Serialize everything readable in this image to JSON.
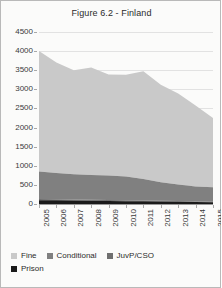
{
  "chart_data": {
    "type": "area",
    "title": "Figure 6.2 - Finland",
    "xlabel": "",
    "ylabel": "",
    "ylim": [
      0,
      4500
    ],
    "yticks": [
      0,
      500,
      1000,
      1500,
      2000,
      2500,
      3000,
      3500,
      4000,
      4500
    ],
    "grid": true,
    "stacked": true,
    "legend_position": "bottom",
    "categories": [
      "2005",
      "2006",
      "2007",
      "2008",
      "2009",
      "2010",
      "2011",
      "2012",
      "2013",
      "2014",
      "2015"
    ],
    "series": [
      {
        "name": "Prison",
        "color": "#1a1a1a",
        "values": [
          100,
          95,
          90,
          85,
          80,
          75,
          70,
          65,
          60,
          50,
          45
        ]
      },
      {
        "name": "JuvP/CSO",
        "color": "#6f6f6f",
        "values": [
          30,
          28,
          26,
          25,
          24,
          23,
          22,
          21,
          20,
          18,
          17
        ]
      },
      {
        "name": "Conditional",
        "color": "#808080",
        "values": [
          720,
          690,
          665,
          650,
          640,
          620,
          560,
          480,
          430,
          390,
          378
        ]
      },
      {
        "name": "Fine",
        "color": "#c9c9c9",
        "values": [
          3150,
          2887,
          2719,
          2810,
          2646,
          2662,
          2818,
          2554,
          2380,
          2122,
          1810
        ]
      }
    ],
    "series_totals": [
      4000,
      3700,
      3500,
      3570,
      3390,
      3380,
      3470,
      3120,
      2890,
      2580,
      2250
    ]
  },
  "legend": {
    "items": [
      {
        "label": "Fine",
        "color": "#c9c9c9"
      },
      {
        "label": "Conditional",
        "color": "#808080"
      },
      {
        "label": "JuvP/CSO",
        "color": "#6f6f6f"
      },
      {
        "label": "Prison",
        "color": "#1a1a1a"
      }
    ]
  }
}
